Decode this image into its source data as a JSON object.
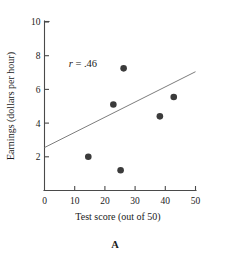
{
  "figure": {
    "panel_label": "A",
    "annotation": {
      "variable": "r",
      "equals": "=",
      "value": ".46",
      "full": "r = .46"
    }
  },
  "chart_data": {
    "type": "scatter",
    "title": "",
    "xlabel": "Test score (out of 50)",
    "ylabel": "Earnings (dollars per hour)",
    "xlim": [
      0,
      50
    ],
    "ylim": [
      0,
      10
    ],
    "xticks": [
      0,
      10,
      20,
      30,
      40,
      50
    ],
    "xticklabels": [
      "0",
      "10",
      "20",
      "30",
      "40",
      "50"
    ],
    "yticks": [
      2,
      4,
      6,
      8,
      10
    ],
    "yticklabels": [
      "2",
      "4",
      "6",
      "8",
      "10"
    ],
    "grid": false,
    "legend": false,
    "points": [
      {
        "x": 14.5,
        "y": 2.0
      },
      {
        "x": 22.8,
        "y": 5.1
      },
      {
        "x": 25.2,
        "y": 1.2
      },
      {
        "x": 26.2,
        "y": 7.25
      },
      {
        "x": 38.2,
        "y": 4.4
      },
      {
        "x": 42.8,
        "y": 5.55
      }
    ],
    "trendline": {
      "name": "regression-line",
      "x0": 0,
      "y0": 2.55,
      "x1": 50,
      "y1": 7.05
    },
    "annotations": [
      {
        "text": "r = .46",
        "x": 8.0,
        "y": 7.35
      }
    ],
    "marker": {
      "shape": "circle",
      "radius": 3.3,
      "color": "#3b3b3b"
    },
    "colors": {
      "marker": "#3b3b3b",
      "line": "#7d7d7d",
      "axis": "#4a4a4a",
      "text": "#1a1a1a",
      "background": "#ffffff"
    }
  }
}
